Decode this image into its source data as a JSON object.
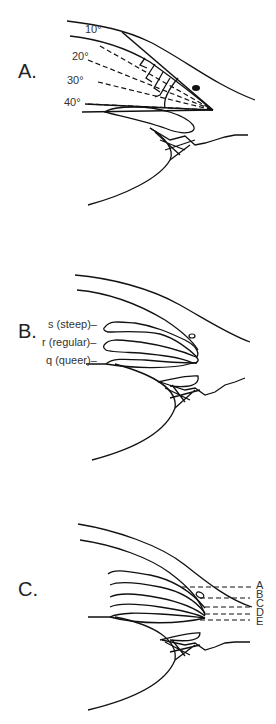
{
  "panels": [
    {
      "id": "A",
      "label": "A.",
      "angles": [
        "10°",
        "20°",
        "30°",
        "40°"
      ]
    },
    {
      "id": "B",
      "label": "B.",
      "configurations": [
        {
          "code": "s",
          "text": "s (steep)–"
        },
        {
          "code": "r",
          "text": "r (regular)–"
        },
        {
          "code": "q",
          "text": "q (queer)–"
        }
      ]
    },
    {
      "id": "C",
      "label": "C.",
      "levels": [
        "A",
        "B",
        "C",
        "D",
        "E"
      ]
    }
  ],
  "colors": {
    "line": "#111111",
    "background": "#ffffff"
  }
}
